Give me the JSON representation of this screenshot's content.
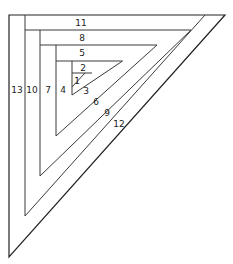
{
  "diagram": {
    "line_color": "#3a3a3a",
    "background": "#ffffff",
    "pieces": [
      {
        "label": "1",
        "x": 77,
        "y": 81
      },
      {
        "label": "2",
        "x": 83,
        "y": 68
      },
      {
        "label": "3",
        "x": 86,
        "y": 91
      },
      {
        "label": "4",
        "x": 63,
        "y": 90
      },
      {
        "label": "5",
        "x": 82,
        "y": 53
      },
      {
        "label": "6",
        "x": 96,
        "y": 102
      },
      {
        "label": "7",
        "x": 48,
        "y": 90
      },
      {
        "label": "8",
        "x": 82,
        "y": 38
      },
      {
        "label": "9",
        "x": 107,
        "y": 113
      },
      {
        "label": "10",
        "x": 32,
        "y": 90
      },
      {
        "label": "11",
        "x": 81,
        "y": 23
      },
      {
        "label": "12",
        "x": 119,
        "y": 124
      },
      {
        "label": "13",
        "x": 17,
        "y": 90
      }
    ]
  }
}
